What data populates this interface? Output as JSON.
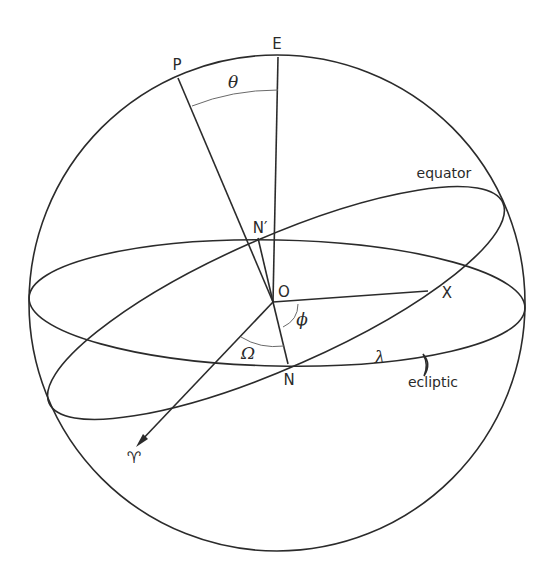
{
  "figure": {
    "type": "celestial-sphere-diagram",
    "colors": {
      "line": "#2b2b2b",
      "arc": "#6a6a6a",
      "background": "#ffffff"
    }
  },
  "points": {
    "E": "E",
    "P": "P",
    "O": "O",
    "N": "N",
    "N_prime": "N′",
    "X": "X"
  },
  "angles": {
    "theta": "θ",
    "phi": "ϕ",
    "Omega": "Ω",
    "lambda": "λ"
  },
  "circles": {
    "equator": "equator",
    "ecliptic": "ecliptic"
  },
  "symbols": {
    "vernal_equinox": "♈",
    "moon": "☽"
  }
}
